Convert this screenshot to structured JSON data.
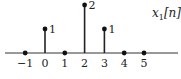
{
  "chart_data": {
    "type": "stem",
    "title": "x1[n]",
    "label_main": "x",
    "label_sub": "1",
    "label_arg": "[n]",
    "xlabel": "n",
    "ylabel": "",
    "categories": [
      "-1",
      "0",
      "1",
      "2",
      "3",
      "4",
      "5"
    ],
    "x": [
      -1,
      0,
      1,
      2,
      3,
      4,
      5
    ],
    "values": [
      0,
      1,
      0,
      2,
      1,
      0,
      0
    ],
    "tick_labels": [
      "−1",
      "0",
      "1",
      "2",
      "3",
      "4",
      "5"
    ],
    "value_labels": {
      "0": "1",
      "2": "2",
      "3": "1"
    },
    "grid": false
  }
}
